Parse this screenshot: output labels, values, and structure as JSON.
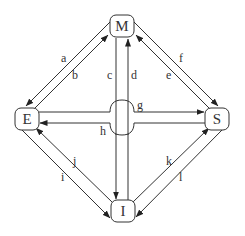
{
  "diagram": {
    "nodes": {
      "M": {
        "label": "M"
      },
      "E": {
        "label": "E"
      },
      "S": {
        "label": "S"
      },
      "I": {
        "label": "I"
      }
    },
    "edges": [
      {
        "label": "a",
        "from": "M",
        "to": "E"
      },
      {
        "label": "b",
        "from": "E",
        "to": "M"
      },
      {
        "label": "c",
        "from": "M",
        "to": "I"
      },
      {
        "label": "d",
        "from": "I",
        "to": "M"
      },
      {
        "label": "e",
        "from": "S",
        "to": "M"
      },
      {
        "label": "f",
        "from": "M",
        "to": "S"
      },
      {
        "label": "g",
        "from": "E",
        "to": "S"
      },
      {
        "label": "h",
        "from": "S",
        "to": "E"
      },
      {
        "label": "i",
        "from": "E",
        "to": "I"
      },
      {
        "label": "j",
        "from": "I",
        "to": "E"
      },
      {
        "label": "k",
        "from": "I",
        "to": "S"
      },
      {
        "label": "l",
        "from": "S",
        "to": "I"
      }
    ]
  }
}
